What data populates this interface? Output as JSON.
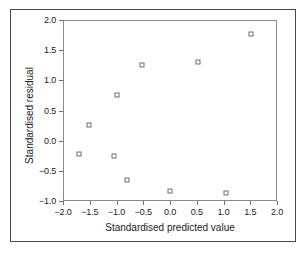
{
  "chart_data": {
    "type": "scatter",
    "title": "",
    "xlabel": "Standardised predicted value",
    "ylabel": "Standardised residual",
    "xlim": [
      -2.0,
      2.0
    ],
    "ylim": [
      -1.0,
      2.0
    ],
    "xticks": [
      "-2.0",
      "-1.5",
      "-1.0",
      "-0.5",
      "0.0",
      "0.5",
      "1.0",
      "1.5",
      "2.0"
    ],
    "xtick_values": [
      -2.0,
      -1.5,
      -1.0,
      -0.5,
      0.0,
      0.5,
      1.0,
      1.5,
      2.0
    ],
    "yticks": [
      "-1.0",
      "-0.5",
      "0.0",
      "0.5",
      "1.0",
      "1.5",
      "2.0"
    ],
    "ytick_values": [
      -1.0,
      -0.5,
      0.0,
      0.5,
      1.0,
      1.5,
      2.0
    ],
    "grid": false,
    "legend": null,
    "marker": "open-square",
    "marker_color": "#6d6d6d",
    "points": [
      {
        "x": -1.7,
        "y": -0.22
      },
      {
        "x": -1.52,
        "y": 0.26
      },
      {
        "x": -1.04,
        "y": -0.26
      },
      {
        "x": -1.0,
        "y": 0.76
      },
      {
        "x": -0.8,
        "y": -0.66
      },
      {
        "x": -0.52,
        "y": 1.26
      },
      {
        "x": 0.0,
        "y": -0.84
      },
      {
        "x": 0.52,
        "y": 1.3
      },
      {
        "x": 1.04,
        "y": -0.87
      },
      {
        "x": 1.52,
        "y": 1.77
      }
    ]
  }
}
